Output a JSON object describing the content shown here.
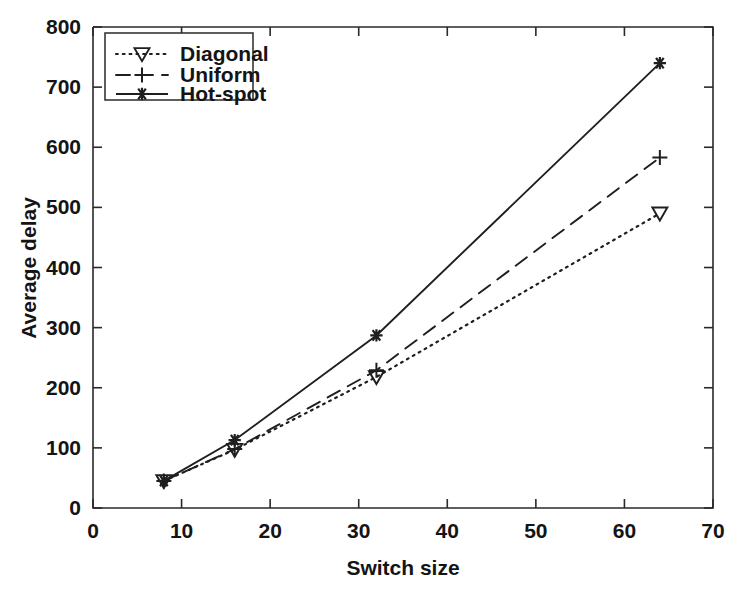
{
  "chart_data": {
    "type": "line",
    "title": "",
    "xlabel": "Switch size",
    "ylabel": "Average delay",
    "x": [
      8,
      16,
      32,
      64
    ],
    "xlim": [
      0,
      70
    ],
    "ylim": [
      0,
      800
    ],
    "xticks": [
      0,
      10,
      20,
      30,
      40,
      50,
      60,
      70
    ],
    "yticks": [
      0,
      100,
      200,
      300,
      400,
      500,
      600,
      700,
      800
    ],
    "xtick_labels": [
      "0",
      "10",
      "20",
      "30",
      "40",
      "50",
      "60",
      "70"
    ],
    "ytick_labels": [
      "0",
      "100",
      "200",
      "300",
      "400",
      "500",
      "600",
      "700",
      "800"
    ],
    "grid": false,
    "legend_position": "upper left",
    "series": [
      {
        "name": "Diagonal",
        "values": [
          45,
          97,
          218,
          490
        ],
        "linestyle": "dotted",
        "marker": "triangle-down",
        "color": "#1f1f1f"
      },
      {
        "name": "Uniform",
        "values": [
          45,
          98,
          229,
          583
        ],
        "linestyle": "dashed",
        "marker": "plus",
        "color": "#1f1f1f"
      },
      {
        "name": "Hot-spot",
        "values": [
          45,
          113,
          287,
          740
        ],
        "linestyle": "solid",
        "marker": "asterisk",
        "color": "#1f1f1f"
      }
    ]
  },
  "legend": {
    "entries": [
      {
        "label": "Diagonal"
      },
      {
        "label": "Uniform"
      },
      {
        "label": "Hot-spot"
      }
    ]
  },
  "axes": {
    "x_title": "Switch size",
    "y_title": "Average delay"
  }
}
